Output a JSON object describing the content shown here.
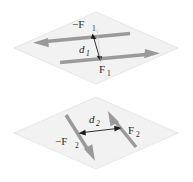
{
  "figure": {
    "background_color": "#ffffff",
    "plane_fill": "#f2f2f2",
    "plane_stroke": "#e0e0e0",
    "arrow_color": "#9a9a9a",
    "dimension_color": "#1a1a1a",
    "label_color": "#2b2b2b"
  },
  "panels": [
    {
      "id": "top-panel",
      "name": "couple-plane-1",
      "orientation": "horizontal",
      "forces": [
        {
          "id": "force-neg-1",
          "label": "−F",
          "subscript": "1",
          "direction": "left",
          "description": "upper arrow pointing left"
        },
        {
          "id": "force-pos-1",
          "label": "F",
          "subscript": "1",
          "direction": "right",
          "description": "lower arrow pointing right"
        }
      ],
      "dimension": {
        "id": "distance-1",
        "label": "d",
        "subscript": "1",
        "description": "perpendicular separation between the two forces"
      }
    },
    {
      "id": "bottom-panel",
      "name": "couple-plane-2",
      "orientation": "diagonal",
      "forces": [
        {
          "id": "force-neg-2",
          "label": "−F",
          "subscript": "2",
          "direction": "down-right",
          "description": "left arrow pointing down and to the right"
        },
        {
          "id": "force-pos-2",
          "label": "F",
          "subscript": "2",
          "direction": "up-right",
          "description": "right arrow pointing up and to the right"
        }
      ],
      "dimension": {
        "id": "distance-2",
        "label": "d",
        "subscript": "2",
        "description": "perpendicular separation between the two forces"
      }
    }
  ]
}
